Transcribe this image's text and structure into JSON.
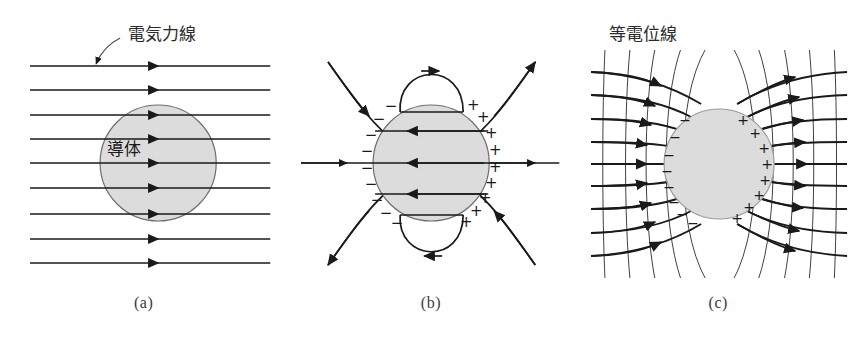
{
  "figure": {
    "background": "#ffffff",
    "line_color": "#1a1a1a",
    "conductor_fill": "#dcdcdc",
    "conductor_stroke": "#6e6e6e",
    "caption_color": "#3a3a3a"
  },
  "panels": [
    {
      "id": "a",
      "caption": "(a)",
      "annotation_label": "電気力線",
      "conductor_label": "導体",
      "field_line_count": 9,
      "field_line_direction": "left-to-right",
      "description": "Uniform horizontal field lines passing a shaded circular conductor"
    },
    {
      "id": "b",
      "caption": "(b)",
      "charge_left_symbol": "−",
      "charge_right_symbol": "+",
      "charge_left_count": 9,
      "charge_right_count": 9,
      "internal_line_count": 3,
      "internal_line_direction": "right-to-left",
      "loop_count": 2,
      "outer_curve_count": 4,
      "description": "Induced negative charge on the left face and positive charge on the right face, with field lines terminating on the surface"
    },
    {
      "id": "c",
      "caption": "(c)",
      "annotation_label": "等電位線",
      "charge_left_symbol": "−",
      "charge_right_symbol": "+",
      "charge_left_count": 8,
      "charge_right_count": 8,
      "field_line_count": 9,
      "equipotential_count": 10,
      "description": "Field lines bending around the conductor crossed perpendicularly by equipotential curves"
    }
  ]
}
